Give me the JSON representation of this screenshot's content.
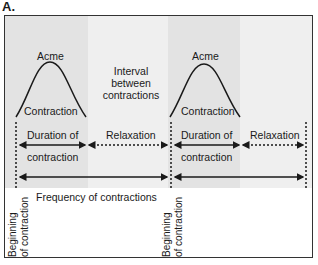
{
  "panel_label": "A.",
  "colors": {
    "contraction_shade": "#e2e2e2",
    "interval_shade": "#efefef",
    "frame": "#333333",
    "ink": "#1a1a1a"
  },
  "cycles": [
    {
      "peak_label": "Acme",
      "curve_label": "Contraction",
      "duration_label": [
        "Duration of",
        "contraction"
      ],
      "relaxation_label": "Relaxation"
    },
    {
      "peak_label": "Acme",
      "curve_label": "Contraction",
      "duration_label": [
        "Duration of",
        "contraction"
      ],
      "relaxation_label": "Relaxation"
    }
  ],
  "interval_label": [
    "Interval",
    "between",
    "contractions"
  ],
  "frequency_label": "Frequency of contractions",
  "beginning_labels": [
    [
      "Beginning",
      "of contraction"
    ],
    [
      "Beginning",
      "of contraction"
    ]
  ]
}
